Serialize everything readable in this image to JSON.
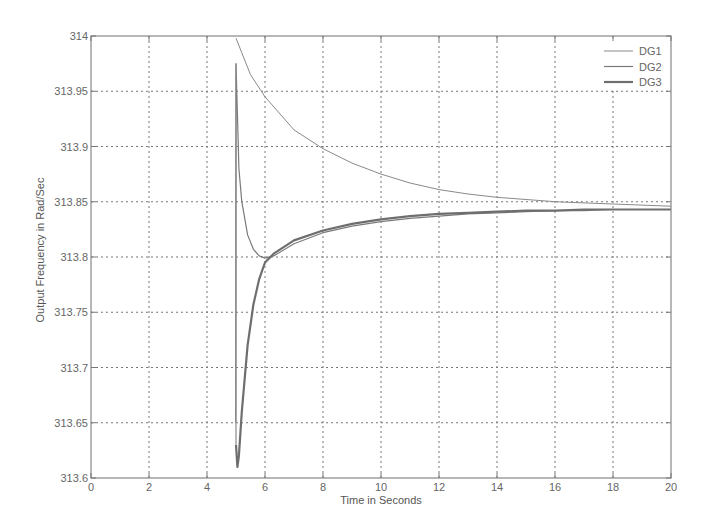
{
  "chart_data": {
    "type": "line",
    "title": "",
    "xlabel": "Time in Seconds",
    "ylabel": "Output Frequency in Rad/Sec",
    "xlim": [
      0,
      20
    ],
    "ylim": [
      313.6,
      314
    ],
    "x_ticks": [
      "0",
      "2",
      "4",
      "6",
      "8",
      "10",
      "12",
      "14",
      "16",
      "18",
      "20"
    ],
    "y_ticks": [
      "313.6",
      "313.65",
      "313.7",
      "313.75",
      "313.8",
      "313.85",
      "313.9",
      "313.95",
      "314"
    ],
    "grid": true,
    "legend_position": "upper right",
    "legend": [
      "DG1",
      "DG2",
      "DG3"
    ],
    "series": [
      {
        "name": "DG1",
        "color": "#8a8a8a",
        "x": [
          5.0,
          5.5,
          6.0,
          7.0,
          8.0,
          9.0,
          10.0,
          11.0,
          12.0,
          13.0,
          14.0,
          15.0,
          16.0,
          17.0,
          18.0,
          19.0,
          20.0
        ],
        "y": [
          313.998,
          313.965,
          313.945,
          313.915,
          313.898,
          313.885,
          313.875,
          313.867,
          313.861,
          313.857,
          313.854,
          313.852,
          313.85,
          313.849,
          313.848,
          313.847,
          313.846
        ]
      },
      {
        "name": "DG2",
        "color": "#7a7a7a",
        "x": [
          4.99,
          5.0,
          5.05,
          5.1,
          5.2,
          5.4,
          5.6,
          5.8,
          6.0,
          6.3,
          7.0,
          8.0,
          9.0,
          10.0,
          11.0,
          12.0,
          13.0,
          14.0,
          15.0,
          16.0,
          17.0,
          18.0,
          19.0,
          20.0
        ],
        "y": [
          313.65,
          313.975,
          313.93,
          313.88,
          313.85,
          313.82,
          313.807,
          313.801,
          313.799,
          313.801,
          313.812,
          313.822,
          313.828,
          313.832,
          313.835,
          313.837,
          313.839,
          313.84,
          313.841,
          313.842,
          313.842,
          313.843,
          313.843,
          313.843
        ]
      },
      {
        "name": "DG3",
        "color": "#6e6e6e",
        "x": [
          5.0,
          5.05,
          5.1,
          5.2,
          5.4,
          5.6,
          5.8,
          6.0,
          6.3,
          7.0,
          8.0,
          9.0,
          10.0,
          11.0,
          12.0,
          13.0,
          14.0,
          15.0,
          16.0,
          17.0,
          18.0,
          19.0,
          20.0
        ],
        "y": [
          313.63,
          313.61,
          313.62,
          313.66,
          313.72,
          313.757,
          313.78,
          313.795,
          313.803,
          313.815,
          313.824,
          313.83,
          313.834,
          313.837,
          313.839,
          313.84,
          313.841,
          313.842,
          313.842,
          313.843,
          313.843,
          313.843,
          313.843
        ]
      }
    ]
  }
}
